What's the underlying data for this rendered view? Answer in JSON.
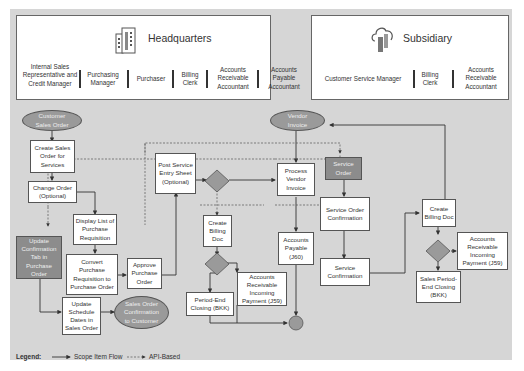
{
  "headquarters": {
    "title": "Headquarters",
    "icon": "building-icon",
    "roles": [
      "Internal Sales Representative and Credit Manager",
      "Purchasing Manager",
      "Purchaser",
      "Billing Clerk",
      "Accounts Receivable Accountant",
      "Accounts Payable Accountant"
    ]
  },
  "subsidiary": {
    "title": "Subsidiary",
    "icon": "cloud-icon",
    "roles": [
      "Customer Service Manager",
      "Billing Clerk",
      "Accounts Receivable Accountant"
    ]
  },
  "nodes": {
    "customer_sales_order": "Customer Sales Order",
    "create_sales_order": "Create Sales Order for Services",
    "change_order": "Change Order (Optional)",
    "display_list_pr": "Display List of Purchase Requisition",
    "update_confirmation_tab": "Update Confirmation Tab in Purchase Order",
    "convert_pr_to_po": "Convert Purchase Requisition to Purchase Order",
    "approve_po": "Approve Purchase Order",
    "update_schedule_dates": "Update Schedule Dates in Sales Order",
    "so_confirmation_customer": "Sales Order Confirmation to Customer",
    "post_service_entry_sheet": "Post Service Entry Sheet (Optional)",
    "create_billing_doc_hq": "Create Billing Doc",
    "period_end_closing": "Period-End Closing (BKK)",
    "ar_incoming_payment_hq": "Accounts Receivable Incoming Payment (J59)",
    "vendor_invoice": "Vendor Invoice",
    "process_vendor_invoice": "Process Vendor Invoice",
    "accounts_payable": "Accounts Payable (J60)",
    "service_order": "Service Order",
    "service_order_confirmation": "Service Order Confirmation",
    "service_confirmation": "Service Confirmation",
    "create_billing_doc_sub": "Create Billing Doc",
    "ar_incoming_payment_sub": "Accounts Receivable Incoming Payment (J59)",
    "sales_period_end_closing": "Sales Period-End Closing (BKK)"
  },
  "legend": {
    "label": "Legend:",
    "scope_item_flow": "Scope Item Flow",
    "api_based": "API-Based"
  },
  "colors": {
    "canvas": "#d6d6d6",
    "dark_node": "#8c8c8c",
    "line": "#333333"
  }
}
